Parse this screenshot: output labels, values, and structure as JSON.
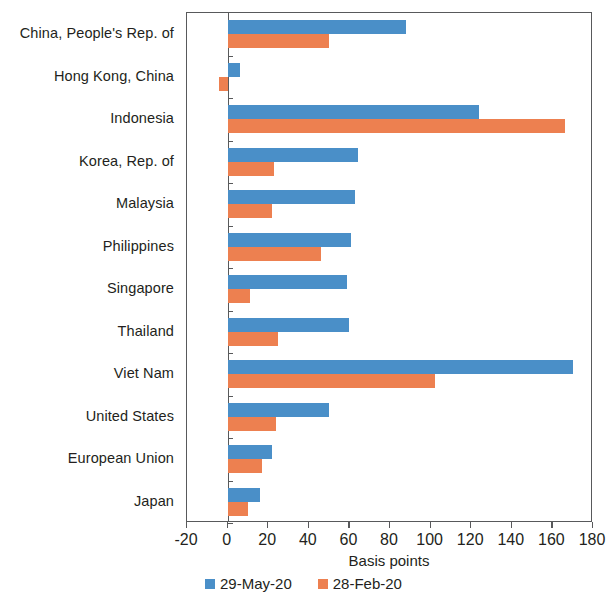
{
  "chart_data": {
    "type": "bar",
    "orientation": "horizontal",
    "title": "",
    "xlabel": "Basis points",
    "ylabel": "",
    "xlim": [
      -20,
      180
    ],
    "xticks": [
      -20,
      0,
      20,
      40,
      60,
      80,
      100,
      120,
      140,
      160,
      180
    ],
    "xtick_labels": [
      "-20",
      "0",
      "20",
      "40",
      "60",
      "80",
      "100",
      "120",
      "140",
      "160",
      "180"
    ],
    "grid": false,
    "legend_position": "bottom-center",
    "categories": [
      "China, People's Rep. of",
      "Hong Kong, China",
      "Indonesia",
      "Korea, Rep. of",
      "Malaysia",
      "Philippines",
      "Singapore",
      "Thailand",
      "Viet Nam",
      "United States",
      "European Union",
      "Japan"
    ],
    "series": [
      {
        "name": "29-May-20",
        "color": "#4a8fc8",
        "values": [
          88,
          6,
          124,
          64,
          63,
          61,
          59,
          60,
          170,
          50,
          22,
          16
        ]
      },
      {
        "name": "28-Feb-20",
        "color": "#ed8050",
        "values": [
          50,
          -4,
          166,
          23,
          22,
          46,
          11,
          25,
          102,
          24,
          17,
          10
        ]
      }
    ]
  },
  "legend": {
    "items": [
      {
        "label": "29-May-20",
        "color": "#4a8fc8"
      },
      {
        "label": "28-Feb-20",
        "color": "#ed8050"
      }
    ]
  },
  "axis": {
    "x_title": "Basis points"
  }
}
